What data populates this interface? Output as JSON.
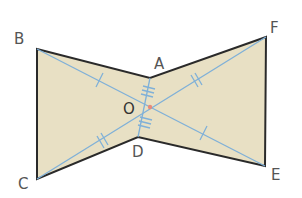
{
  "figure": {
    "type": "geometric-diagram",
    "colors": {
      "fill": "#e8e0c4",
      "outline": "#2a2a2a",
      "diagonal": "#7fb0d8",
      "center_point": "#e88a7a",
      "label": "#555555"
    },
    "points": {
      "B": {
        "label": "B",
        "x": 37,
        "y": 49
      },
      "A": {
        "label": "A",
        "x": 150,
        "y": 78
      },
      "F": {
        "label": "F",
        "x": 266,
        "y": 37
      },
      "E": {
        "label": "E",
        "x": 265,
        "y": 166
      },
      "D": {
        "label": "D",
        "x": 138,
        "y": 137
      },
      "C": {
        "label": "C",
        "x": 37,
        "y": 179
      },
      "O": {
        "label": "O",
        "x": 150,
        "y": 107
      }
    },
    "segments": [
      {
        "name": "BO",
        "ticks": 1
      },
      {
        "name": "OE",
        "ticks": 1
      },
      {
        "name": "CO",
        "ticks": 2
      },
      {
        "name": "OF",
        "ticks": 2
      },
      {
        "name": "AO",
        "ticks": 3
      },
      {
        "name": "OD",
        "ticks": 3
      }
    ]
  },
  "labels": {
    "B": "B",
    "A": "A",
    "F": "F",
    "O": "O",
    "D": "D",
    "C": "C",
    "E": "E"
  }
}
